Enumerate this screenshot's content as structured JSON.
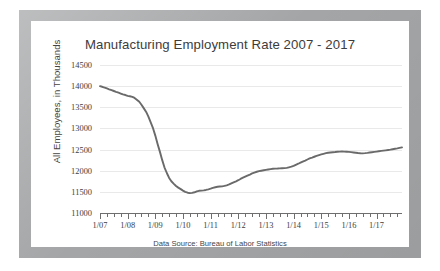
{
  "figure": {
    "frame_color": "#a3a5a6",
    "card_background": "#ffffff"
  },
  "chart_data": {
    "type": "line",
    "title": "Manufacturing Employment Rate 2007 - 2017",
    "subtitle": "",
    "xlabel": "",
    "ylabel": "All Employees, in Thousands",
    "source_note": "Data Source: Bureau of Labor Statistics",
    "grid": true,
    "grid_axis": "y",
    "legend": false,
    "legend_position": "none",
    "line_color": "#6a6a6a",
    "line_width": 1.9,
    "ylim": [
      11000,
      14500
    ],
    "yticks": [
      11000,
      11500,
      12000,
      12500,
      13000,
      13500,
      14000,
      14500
    ],
    "ytick_labels": [
      "11000",
      "11500",
      "12000",
      "12500",
      "13000",
      "13500",
      "14000",
      "14500"
    ],
    "xlim": [
      2007.0,
      2017.92
    ],
    "xticks": [
      2007,
      2008,
      2009,
      2010,
      2011,
      2012,
      2013,
      2014,
      2015,
      2016,
      2017
    ],
    "xtick_labels": [
      "1/07",
      "1/08",
      "1/09",
      "1/10",
      "1/11",
      "1/12",
      "1/13",
      "1/14",
      "1/15",
      "1/16",
      "1/17"
    ],
    "minor_tick_interval": 0.25,
    "series": [
      {
        "name": "All Employees, Manufacturing",
        "x": [
          2007.0,
          2007.08,
          2007.17,
          2007.25,
          2007.33,
          2007.42,
          2007.5,
          2007.58,
          2007.67,
          2007.75,
          2007.83,
          2007.92,
          2008.0,
          2008.08,
          2008.17,
          2008.25,
          2008.33,
          2008.42,
          2008.5,
          2008.58,
          2008.67,
          2008.75,
          2008.83,
          2008.92,
          2009.0,
          2009.08,
          2009.17,
          2009.25,
          2009.33,
          2009.42,
          2009.5,
          2009.58,
          2009.67,
          2009.75,
          2009.83,
          2009.92,
          2010.0,
          2010.08,
          2010.17,
          2010.25,
          2010.33,
          2010.42,
          2010.5,
          2010.58,
          2010.67,
          2010.75,
          2010.83,
          2010.92,
          2011.0,
          2011.08,
          2011.17,
          2011.25,
          2011.33,
          2011.42,
          2011.5,
          2011.58,
          2011.67,
          2011.75,
          2011.83,
          2011.92,
          2012.0,
          2012.08,
          2012.17,
          2012.25,
          2012.33,
          2012.42,
          2012.5,
          2012.58,
          2012.67,
          2012.75,
          2012.83,
          2012.92,
          2013.0,
          2013.08,
          2013.17,
          2013.25,
          2013.33,
          2013.42,
          2013.5,
          2013.58,
          2013.67,
          2013.75,
          2013.83,
          2013.92,
          2014.0,
          2014.08,
          2014.17,
          2014.25,
          2014.33,
          2014.42,
          2014.5,
          2014.58,
          2014.67,
          2014.75,
          2014.83,
          2014.92,
          2015.0,
          2015.08,
          2015.17,
          2015.25,
          2015.33,
          2015.42,
          2015.5,
          2015.58,
          2015.67,
          2015.75,
          2015.83,
          2015.92,
          2016.0,
          2016.08,
          2016.17,
          2016.25,
          2016.33,
          2016.42,
          2016.5,
          2016.58,
          2016.67,
          2016.75,
          2016.83,
          2016.92,
          2017.0,
          2017.08,
          2017.17,
          2017.25,
          2017.33,
          2017.42,
          2017.5,
          2017.58,
          2017.67,
          2017.75,
          2017.83,
          2017.92
        ],
        "values": [
          14000,
          13985,
          13965,
          13945,
          13925,
          13905,
          13885,
          13865,
          13845,
          13825,
          13805,
          13790,
          13770,
          13760,
          13745,
          13720,
          13680,
          13630,
          13560,
          13480,
          13390,
          13280,
          13150,
          13000,
          12830,
          12640,
          12440,
          12250,
          12080,
          11940,
          11830,
          11750,
          11690,
          11640,
          11600,
          11565,
          11530,
          11500,
          11480,
          11470,
          11475,
          11490,
          11510,
          11525,
          11530,
          11535,
          11545,
          11560,
          11575,
          11595,
          11610,
          11620,
          11625,
          11630,
          11640,
          11655,
          11675,
          11700,
          11725,
          11750,
          11775,
          11805,
          11835,
          11860,
          11885,
          11910,
          11935,
          11955,
          11975,
          11990,
          12000,
          12010,
          12020,
          12030,
          12038,
          12045,
          12050,
          12052,
          12055,
          12058,
          12062,
          12068,
          12080,
          12095,
          12115,
          12140,
          12165,
          12190,
          12215,
          12240,
          12265,
          12290,
          12310,
          12330,
          12350,
          12370,
          12385,
          12400,
          12415,
          12425,
          12432,
          12438,
          12442,
          12448,
          12452,
          12455,
          12452,
          12448,
          12445,
          12440,
          12432,
          12425,
          12418,
          12412,
          12410,
          12415,
          12422,
          12430,
          12438,
          12445,
          12452,
          12460,
          12468,
          12475,
          12482,
          12490,
          12498,
          12508,
          12518,
          12528,
          12540,
          12552
        ]
      }
    ]
  }
}
